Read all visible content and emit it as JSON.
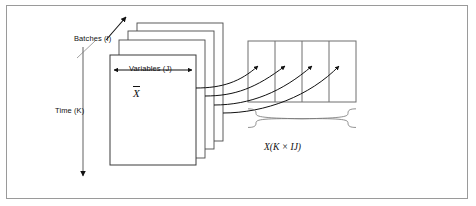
{
  "diagram": {
    "border_color": "#9a9a9a",
    "line_color": "#111111",
    "background": "#ffffff",
    "labels": {
      "batches": "Batches (I)",
      "variables": "Variables (J)",
      "time": "Time (K)",
      "mean_symbol": "X",
      "unfolded_matrix": "X(K × IJ)"
    },
    "structure": {
      "stacked_slabs": 4,
      "matrix_columns": 4,
      "mapping_arrows": 4,
      "brace_label": "X(K × IJ)"
    },
    "icons": {
      "batches_arrow": "arrow-up-right-icon",
      "variables_arrow": "double-headed-horizontal-arrow-icon",
      "time_arrow": "arrow-down-icon",
      "mapping_arrow": "curved-arrow-icon",
      "brace": "curly-brace-icon"
    }
  }
}
